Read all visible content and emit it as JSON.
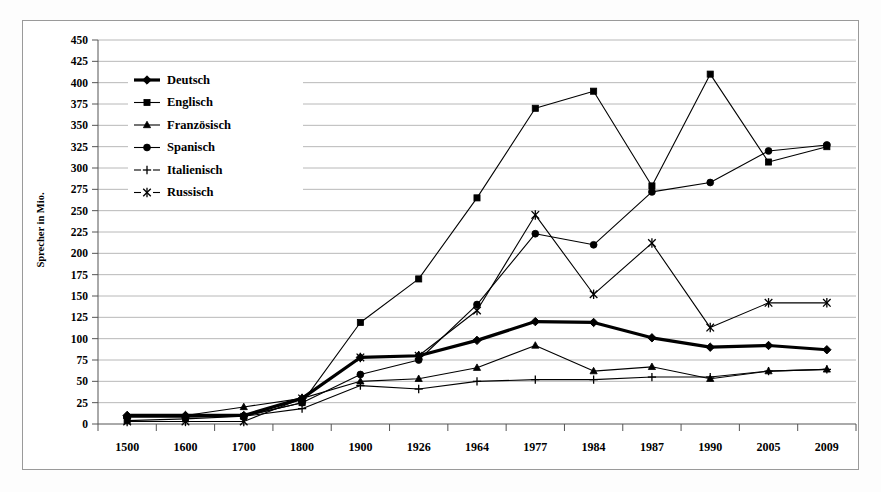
{
  "figure": {
    "y_axis_title": "Sprecher in Mio."
  },
  "legend": {
    "position": "top-left-inside",
    "items": [
      {
        "label": "Deutsch",
        "marker": "diamond",
        "weight": "bold",
        "color": "#000000"
      },
      {
        "label": "Englisch",
        "marker": "square",
        "weight": "normal",
        "color": "#000000"
      },
      {
        "label": "Französisch",
        "marker": "triangle",
        "weight": "normal",
        "color": "#000000"
      },
      {
        "label": "Spanisch",
        "marker": "circle",
        "weight": "normal",
        "color": "#000000"
      },
      {
        "label": "Italienisch",
        "marker": "plus",
        "weight": "normal",
        "color": "#000000"
      },
      {
        "label": "Russisch",
        "marker": "cross",
        "weight": "normal",
        "color": "#000000"
      }
    ]
  },
  "chart_data": {
    "type": "line",
    "title": "",
    "xlabel": "",
    "ylabel": "Sprecher in Mio.",
    "grid": true,
    "legend_position": "top-left-inside",
    "ylim": [
      0,
      450
    ],
    "ytick_step": 25,
    "ytick_labels": [
      "0",
      "25",
      "50",
      "75",
      "100",
      "125",
      "150",
      "175",
      "200",
      "225",
      "250",
      "275",
      "300",
      "325",
      "350",
      "375",
      "400",
      "425",
      "450"
    ],
    "categories": [
      "1500",
      "1600",
      "1700",
      "1800",
      "1900",
      "1926",
      "1964",
      "1977",
      "1984",
      "1987",
      "1990",
      "2005",
      "2009"
    ],
    "series": [
      {
        "name": "Deutsch",
        "marker": "diamond",
        "values": [
          10,
          10,
          10,
          30,
          78,
          80,
          98,
          120,
          119,
          101,
          90,
          92,
          87
        ]
      },
      {
        "name": "Englisch",
        "marker": "square",
        "values": [
          4,
          6,
          9,
          25,
          119,
          170,
          265,
          370,
          390,
          279,
          410,
          307,
          325
        ]
      },
      {
        "name": "Französisch",
        "marker": "triangle",
        "values": [
          10,
          10,
          20,
          30,
          50,
          53,
          66,
          92,
          62,
          67,
          53,
          62,
          64
        ]
      },
      {
        "name": "Spanisch",
        "marker": "circle",
        "values": [
          8,
          8,
          9,
          25,
          58,
          75,
          140,
          223,
          210,
          272,
          283,
          320,
          327
        ]
      },
      {
        "name": "Italienisch",
        "marker": "plus",
        "values": [
          9,
          9,
          9,
          18,
          45,
          41,
          50,
          52,
          52,
          55,
          55,
          62,
          64
        ]
      },
      {
        "name": "Russisch",
        "marker": "cross",
        "values": [
          3,
          3,
          3,
          30,
          78,
          80,
          133,
          245,
          152,
          212,
          113,
          142,
          142
        ]
      }
    ]
  }
}
